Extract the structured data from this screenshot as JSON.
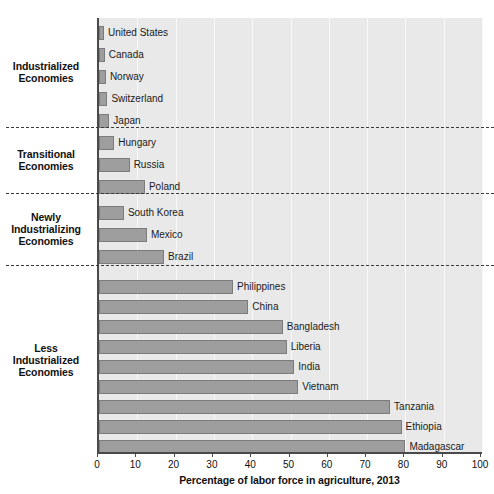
{
  "top_sliver_text": "",
  "chart_data": {
    "type": "bar",
    "orientation": "horizontal",
    "title": "",
    "xlabel": "Percentage of labor force in agriculture, 2013",
    "ylabel": "",
    "xlim": [
      0,
      100
    ],
    "xticks": [
      0,
      10,
      20,
      30,
      40,
      50,
      60,
      70,
      80,
      90,
      100
    ],
    "xtick_labels": [
      "0",
      "10",
      "20",
      "30",
      "40",
      "50",
      "60",
      "70",
      "80",
      "90",
      "100"
    ],
    "grid": true,
    "legend": "none",
    "plot_background": "#e9e9e9",
    "bar_color": "#9e9e9e",
    "bar_edge_color": "#7b7b7b",
    "groups": [
      {
        "label": "Industrialized Economies",
        "label_lines": [
          "Industrialized",
          "Economies"
        ],
        "bars": [
          {
            "category": "United States",
            "value": 1.0
          },
          {
            "category": "Canada",
            "value": 1.5
          },
          {
            "category": "Norway",
            "value": 1.8
          },
          {
            "category": "Switzerland",
            "value": 2.2
          },
          {
            "category": "Japan",
            "value": 2.7
          }
        ]
      },
      {
        "label": "Transitional Economies",
        "label_lines": [
          "Transitional",
          "Economies"
        ],
        "bars": [
          {
            "category": "Hungary",
            "value": 4.0
          },
          {
            "category": "Russia",
            "value": 8.0
          },
          {
            "category": "Poland",
            "value": 12.0
          }
        ]
      },
      {
        "label": "Newly Industrializing Economies",
        "label_lines": [
          "Newly",
          "Industrializing",
          "Economies"
        ],
        "bars": [
          {
            "category": "South Korea",
            "value": 6.5
          },
          {
            "category": "Mexico",
            "value": 12.5
          },
          {
            "category": "Brazil",
            "value": 17.0
          }
        ]
      },
      {
        "label": "Less Industrialized Economies",
        "label_lines": [
          "Less",
          "Industrialized",
          "Economies"
        ],
        "bars": [
          {
            "category": "Philippines",
            "value": 35.0
          },
          {
            "category": "China",
            "value": 39.0
          },
          {
            "category": "Bangladesh",
            "value": 48.0
          },
          {
            "category": "Liberia",
            "value": 49.0
          },
          {
            "category": "India",
            "value": 51.0
          },
          {
            "category": "Vietnam",
            "value": 52.0
          },
          {
            "category": "Tanzania",
            "value": 76.0
          },
          {
            "category": "Ethiopia",
            "value": 79.0
          },
          {
            "category": "Madagascar",
            "value": 80.0
          }
        ]
      }
    ]
  }
}
